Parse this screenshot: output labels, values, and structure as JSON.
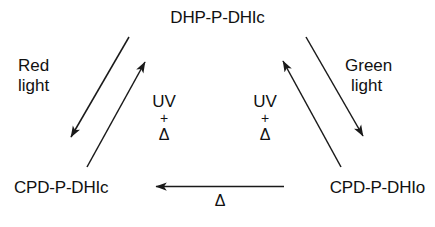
{
  "figure": {
    "background_color": "#ffffff",
    "stroke_color": "#1a1a1a",
    "text_color": "#111111"
  },
  "nodes": {
    "top": "DHP-P-DHIc",
    "bottom_left": "CPD-P-DHIc",
    "bottom_right": "CPD-P-DHIo"
  },
  "conditions": {
    "red_light": {
      "line1": "Red",
      "line2": "light"
    },
    "green_light": {
      "line1": "Green",
      "line2": "light"
    },
    "uv_left": {
      "line1": "UV",
      "plus": "+",
      "delta": "Δ"
    },
    "uv_right": {
      "line1": "UV",
      "plus": "+",
      "delta": "Δ"
    },
    "thermal_bottom": {
      "delta": "Δ"
    }
  },
  "arrows": [
    {
      "name": "red-light-arrow",
      "direction": "down-left",
      "from_node": "DHP-P-DHIc",
      "to_node": "CPD-P-DHIc",
      "label": "Red light"
    },
    {
      "name": "uv-left-arrow",
      "direction": "up-right",
      "from_node": "CPD-P-DHIc",
      "to_node": "DHP-P-DHIc",
      "label": "UV + Δ"
    },
    {
      "name": "green-light-arrow",
      "direction": "down-right",
      "from_node": "DHP-P-DHIc",
      "to_node": "CPD-P-DHIo",
      "label": "Green light"
    },
    {
      "name": "uv-right-arrow",
      "direction": "up-left",
      "from_node": "CPD-P-DHIo",
      "to_node": "DHP-P-DHIc",
      "label": "UV + Δ"
    },
    {
      "name": "thermal-arrow",
      "direction": "left",
      "from_node": "CPD-P-DHIo",
      "to_node": "CPD-P-DHIc",
      "label": "Δ"
    }
  ]
}
